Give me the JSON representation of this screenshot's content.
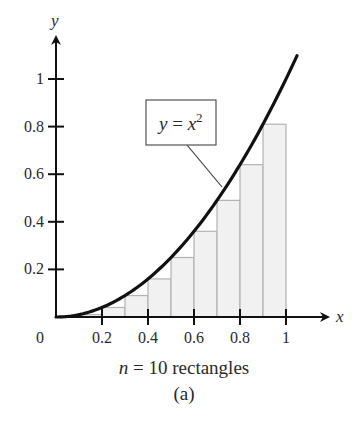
{
  "chart_data": {
    "type": "bar",
    "subtype": "riemann-sum-left-endpoint",
    "title": "",
    "function": "y = x^2",
    "function_label": {
      "base": "y = x",
      "exponent": "2"
    },
    "xlabel": "x",
    "ylabel": "y",
    "origin_label": "0",
    "x_ticks": [
      0.2,
      0.4,
      0.6,
      0.8,
      1
    ],
    "x_tick_labels": [
      "0.2",
      "0.4",
      "0.6",
      "0.8",
      "1"
    ],
    "y_ticks": [
      0.2,
      0.4,
      0.6,
      0.8,
      1
    ],
    "y_tick_labels": [
      "0.2",
      "0.4",
      "0.6",
      "0.8",
      "1"
    ],
    "xlim": [
      0,
      1.048
    ],
    "ylim": [
      0,
      1.1
    ],
    "grid": false,
    "legend": "none",
    "n_rectangles": 10,
    "rectangles": {
      "x_left": [
        0,
        0.1,
        0.2,
        0.3,
        0.4,
        0.5,
        0.6,
        0.7,
        0.8,
        0.9
      ],
      "width": 0.1,
      "heights": [
        0,
        0.01,
        0.04,
        0.09,
        0.16,
        0.25,
        0.36,
        0.49,
        0.64,
        0.81
      ]
    },
    "curve_x_max": 1.048,
    "caption": "n = 10 rectangles",
    "caption_parts": {
      "var": "n",
      "rest": " = 10 rectangles"
    },
    "subcaption": "(a)",
    "colors": {
      "curve": "#111111",
      "axes": "#111111",
      "rect_fill": "#f1f1f1",
      "rect_stroke": "#b3b3b3",
      "text": "#2a2a2a"
    }
  }
}
